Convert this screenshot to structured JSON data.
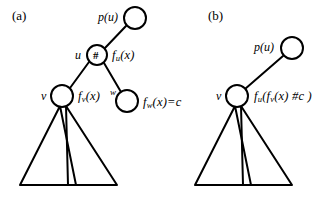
{
  "figure": {
    "caption_panels": [
      {
        "id": "a",
        "label": "(a)"
      },
      {
        "id": "b",
        "label": "(b)"
      }
    ],
    "panel_a": {
      "label": "(a)",
      "nodes": [
        {
          "id": "pu",
          "name_label": "p(u)",
          "glyph": "",
          "cx": 135,
          "cy": 18,
          "r": 11
        },
        {
          "id": "u",
          "name_label": "u",
          "glyph": "#",
          "cx": 97,
          "cy": 55,
          "r": 10
        },
        {
          "id": "v",
          "name_label": "v",
          "glyph": "",
          "cx": 62,
          "cy": 96,
          "r": 11
        },
        {
          "id": "w",
          "name_label": "w",
          "glyph": "",
          "cx": 127,
          "cy": 101,
          "r": 11
        }
      ],
      "function_labels": [
        {
          "id": "fu",
          "text": "f_u(x)",
          "head": "f",
          "sub": "u",
          "tail": "(x)"
        },
        {
          "id": "fv",
          "text": "f_v(x)",
          "head": "f",
          "sub": "v",
          "tail": "(x)"
        },
        {
          "id": "fw",
          "text": "f_w(x)=c",
          "head": "f",
          "sub": "w",
          "tail": "(x)=c"
        }
      ],
      "subtree_count": 2
    },
    "panel_b": {
      "label": "(b)",
      "nodes": [
        {
          "id": "pu",
          "name_label": "p(u)",
          "glyph": "",
          "cx": 292,
          "cy": 48,
          "r": 11
        },
        {
          "id": "v",
          "name_label": "v",
          "glyph": "",
          "cx": 237,
          "cy": 96,
          "r": 11
        }
      ],
      "function_labels": [
        {
          "id": "fuv",
          "text": "f_u(f_v(x) #c)",
          "head": "f",
          "sub": "u",
          "mid": "(f",
          "sub2": "v",
          "tail": "(x) #c )"
        }
      ],
      "subtree_count": 2
    },
    "style": {
      "stroke_color": "#000000",
      "fill_color": "#ffffff",
      "background": "#ffffff",
      "node_stroke_width": 2,
      "edge_stroke_width": 2,
      "triangle_stroke_width": 2
    }
  }
}
